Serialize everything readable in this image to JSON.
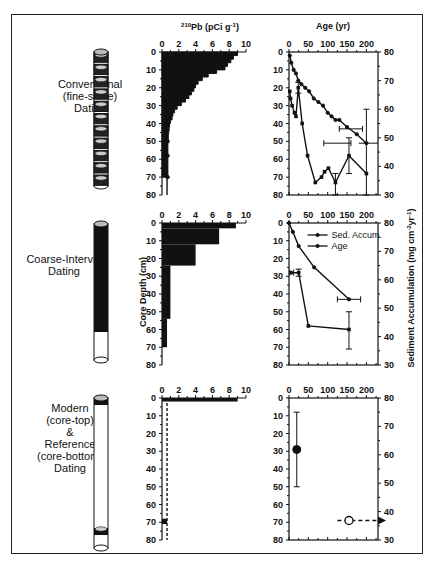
{
  "figure": {
    "rows": [
      {
        "label_lines": [
          "Conventional",
          "(fine-scale)",
          "Dating"
        ]
      },
      {
        "label_lines": [
          "Coarse-Interval",
          "Dating"
        ]
      },
      {
        "label_lines": [
          "Modern",
          "(core-top)",
          "&",
          "Reference",
          "(core-bottom)",
          "Dating"
        ]
      }
    ],
    "pb_axis_title": "210Pb  (pCi g-1)",
    "age_axis_title": "Age (yr)",
    "left_axis_title": "Core Depth (cm)",
    "right_axis_title": "Sediment Accumulation  (mg cm-2 yr-1)",
    "legend": {
      "sed": "Sed. Accum.",
      "age": "Age"
    }
  },
  "chart_data": [
    {
      "id": "pb-conventional",
      "type": "bar",
      "orientation": "horizontal-profile",
      "title": "210Pb (pCi g-1)",
      "xlabel": "210Pb (pCi g-1)",
      "ylabel": "Core Depth (cm)",
      "xlim": [
        0,
        10
      ],
      "ylim": [
        0,
        80
      ],
      "xticks": [
        0,
        2,
        4,
        6,
        8,
        10
      ],
      "yticks": [
        0,
        10,
        20,
        30,
        40,
        50,
        60,
        70,
        80
      ],
      "depth": [
        0,
        2,
        4,
        6,
        8,
        10,
        12,
        14,
        16,
        18,
        20,
        22,
        24,
        26,
        28,
        30,
        32,
        34,
        36,
        38,
        40,
        42,
        44,
        46,
        50,
        58,
        70
      ],
      "values": [
        9.0,
        8.5,
        8.2,
        7.8,
        7.5,
        6.5,
        5.5,
        4.8,
        4.3,
        4.0,
        3.8,
        3.5,
        3.2,
        2.8,
        2.3,
        1.8,
        1.5,
        1.3,
        1.2,
        1.0,
        0.9,
        0.85,
        0.8,
        0.75,
        0.7,
        0.7,
        0.6
      ]
    },
    {
      "id": "age-conventional",
      "type": "line",
      "xlabel": "Age (yr)",
      "ylabel": "Core Depth (cm)",
      "y2label": "Sediment Accumulation (mg cm-2 yr-1)",
      "xlim": [
        0,
        230
      ],
      "ylim": [
        0,
        80
      ],
      "y2lim": [
        30,
        80
      ],
      "xticks": [
        0,
        50,
        100,
        150,
        200
      ],
      "yticks": [
        0,
        10,
        20,
        30,
        40,
        50,
        60,
        70,
        80
      ],
      "y2ticks": [
        30,
        40,
        50,
        60,
        70,
        80
      ],
      "series": [
        {
          "name": "Age",
          "axis": "left",
          "x": [
            2,
            6,
            12,
            18,
            24,
            32,
            42,
            52,
            64,
            76,
            88,
            100,
            110,
            120,
            130,
            150,
            175,
            200
          ],
          "y": [
            2,
            6,
            10,
            12,
            16,
            18,
            20,
            22,
            26,
            28,
            30,
            34,
            36,
            38,
            38,
            42,
            46,
            51
          ]
        },
        {
          "name": "Sed. Accum.",
          "axis": "right",
          "depth": [
            22,
            26,
            30,
            34,
            36,
            20,
            40,
            58,
            73,
            70,
            67,
            65,
            73,
            58,
            68
          ],
          "x": [
            2,
            4,
            8,
            14,
            18,
            24,
            34,
            48,
            68,
            84,
            92,
            102,
            120,
            155,
            200
          ],
          "y": [
            66,
            63,
            61,
            58,
            57,
            68,
            55,
            44,
            34,
            36,
            38,
            39,
            34,
            43,
            37
          ]
        }
      ],
      "error_bars": [
        {
          "type": "horizontal",
          "y_depth": 43,
          "x_range": [
            130,
            190
          ]
        },
        {
          "type": "horizontal",
          "y_depth": 51,
          "x_range": [
            90,
            230
          ]
        },
        {
          "type": "vertical",
          "x": 155,
          "y2_range": [
            37,
            50
          ]
        },
        {
          "type": "vertical",
          "x": 200,
          "y2_range": [
            30,
            60
          ]
        }
      ]
    },
    {
      "id": "pb-coarse",
      "type": "bar",
      "orientation": "horizontal-profile",
      "xlim": [
        0,
        10
      ],
      "ylim": [
        0,
        80
      ],
      "xticks": [
        0,
        2,
        4,
        6,
        8,
        10
      ],
      "yticks": [
        0,
        10,
        20,
        30,
        40,
        50,
        60,
        70,
        80
      ],
      "intervals": [
        {
          "top": 0,
          "bottom": 3,
          "value": 8.8
        },
        {
          "top": 3,
          "bottom": 12,
          "value": 6.8
        },
        {
          "top": 12,
          "bottom": 24,
          "value": 4.0
        },
        {
          "top": 24,
          "bottom": 54,
          "value": 1.0
        },
        {
          "top": 54,
          "bottom": 70,
          "value": 0.6
        }
      ]
    },
    {
      "id": "age-coarse",
      "type": "line",
      "xlim": [
        0,
        230
      ],
      "ylim": [
        0,
        80
      ],
      "y2lim": [
        30,
        80
      ],
      "xticks": [
        0,
        50,
        100,
        150,
        200
      ],
      "yticks": [
        0,
        10,
        20,
        30,
        40,
        50,
        60,
        70,
        80
      ],
      "y2ticks": [
        30,
        40,
        50,
        60,
        70,
        80
      ],
      "legend": [
        "Sed. Accum.",
        "Age"
      ],
      "series": [
        {
          "name": "Age",
          "axis": "left",
          "x": [
            0,
            10,
            25,
            65,
            155
          ],
          "y": [
            0,
            5,
            13,
            25,
            43
          ]
        },
        {
          "name": "Sed. Accum.",
          "axis": "right",
          "x": [
            5,
            25,
            50,
            155
          ],
          "y": [
            62,
            62,
            43,
            42
          ]
        }
      ],
      "error_bars": [
        {
          "type": "horizontal",
          "y_depth": 43,
          "x_range": [
            125,
            185
          ]
        },
        {
          "type": "vertical",
          "x": 155,
          "y2_range": [
            35,
            48
          ]
        },
        {
          "type": "vertical",
          "x": 25,
          "y2_range": [
            61,
            63
          ]
        }
      ]
    },
    {
      "id": "pb-modern",
      "type": "bar",
      "xlim": [
        0,
        10
      ],
      "ylim": [
        0,
        80
      ],
      "xticks": [
        0,
        2,
        4,
        6,
        8,
        10
      ],
      "yticks": [
        0,
        10,
        20,
        30,
        40,
        50,
        60,
        70,
        80
      ],
      "intervals": [
        {
          "top": 0,
          "bottom": 2,
          "value": 9.0
        },
        {
          "top": 68,
          "bottom": 71,
          "value": 0.6
        }
      ],
      "dashed_line_x": 0.6
    },
    {
      "id": "age-modern",
      "type": "scatter",
      "xlim": [
        0,
        230
      ],
      "ylim": [
        0,
        80
      ],
      "y2lim": [
        30,
        80
      ],
      "xticks": [
        0,
        50,
        100,
        150,
        200
      ],
      "yticks": [
        0,
        10,
        20,
        30,
        40,
        50,
        60,
        70,
        80
      ],
      "y2ticks": [
        30,
        40,
        50,
        60,
        70,
        80
      ],
      "points": [
        {
          "name": "Sed. Accum. (core-top)",
          "x": 20,
          "y2": 61,
          "filled": true,
          "error_y2": [
            50,
            75
          ]
        },
        {
          "name": "Age (core-bottom)",
          "x": 155,
          "y": 69,
          "filled": false,
          "dashed_to": [
            125,
            230
          ],
          "arrow": "right"
        }
      ]
    }
  ]
}
